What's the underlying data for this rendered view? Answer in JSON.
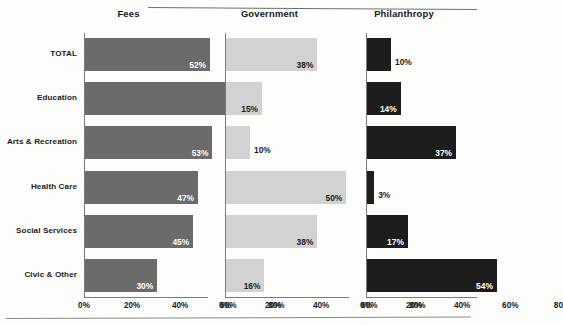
{
  "chart_data": {
    "type": "bar",
    "title": "",
    "orientation": "horizontal",
    "categories": [
      "TOTAL",
      "Education",
      "Arts & Recreation",
      "Health Care",
      "Social Services",
      "Civic & Other"
    ],
    "xlabel": "",
    "ylabel": "",
    "xlim": [
      0,
      80
    ],
    "tick_labels": [
      "0%",
      "20%",
      "40%",
      "60%",
      "80%"
    ],
    "tick_values": [
      0,
      20,
      40,
      60,
      80
    ],
    "grid": false,
    "legend": "none",
    "panels": [
      {
        "title": "Fees",
        "color": "#6b6b6b",
        "label_color_inside": "#ffffff",
        "values": [
          52,
          72,
          53,
          47,
          45,
          30
        ],
        "value_labels": [
          "52%",
          "72%",
          "53%",
          "47%",
          "45%",
          "30%"
        ],
        "label_placement": [
          "inside",
          "inside",
          "inside",
          "inside",
          "inside",
          "inside"
        ],
        "tick_labels": [
          "0%",
          "20%",
          "40%",
          "60%",
          "80%"
        ]
      },
      {
        "title": "Government",
        "color": "#d2d2d2",
        "label_color_inside": "#1b1b1b",
        "values": [
          38,
          15,
          10,
          50,
          38,
          16
        ],
        "value_labels": [
          "38%",
          "15%",
          "10%",
          "50%",
          "38%",
          "16%"
        ],
        "label_placement": [
          "inside",
          "inside",
          "outside",
          "inside",
          "inside",
          "inside"
        ],
        "tick_labels": [
          "0%",
          "20%",
          "40%",
          "60%",
          "80%"
        ]
      },
      {
        "title": "Philanthropy",
        "color": "#1d1d1d",
        "label_color_inside": "#ffffff",
        "values": [
          10,
          14,
          37,
          3,
          17,
          54
        ],
        "value_labels": [
          "10%",
          "14%",
          "37%",
          "3%",
          "17%",
          "54%"
        ],
        "label_placement": [
          "outside",
          "inside",
          "inside",
          "outside",
          "inside",
          "inside"
        ],
        "tick_labels": [
          "0%",
          "20%",
          "40%",
          "60%",
          "80"
        ]
      }
    ]
  }
}
